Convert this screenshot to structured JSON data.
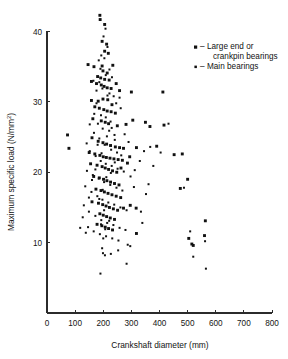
{
  "chart_data": {
    "type": "scatter",
    "title": "",
    "xlabel": "Crankshaft diameter (mm)",
    "ylabel": "Maximum specific load (N/mm²)",
    "ylabel_base": "Maximum specific load (N/mm",
    "ylabel_sup": "2",
    "ylabel_tail": ")",
    "xlim": [
      0,
      800
    ],
    "ylim": [
      0,
      42.5
    ],
    "grid": false,
    "xticks": [
      0,
      100,
      200,
      300,
      400,
      500,
      600,
      700,
      800
    ],
    "xtick_labels": [
      "0",
      "100",
      "200",
      "300",
      "400",
      "500",
      "600",
      "700",
      "800"
    ],
    "yticks": [
      10,
      20,
      30,
      40
    ],
    "ytick_labels": [
      "10",
      "20",
      "30",
      "40"
    ],
    "legend_position": "upper-right",
    "series": [
      {
        "name": "Large end or crankpin bearings",
        "marker": "square-large",
        "color": "#111111",
        "points": [
          [
            188,
            42.3
          ],
          [
            189,
            41.7
          ],
          [
            205,
            41.0
          ],
          [
            196,
            38.6
          ],
          [
            212,
            38.2
          ],
          [
            205,
            37.2
          ],
          [
            218,
            36.9
          ],
          [
            146,
            35.3
          ],
          [
            167,
            35.0
          ],
          [
            196,
            35.1
          ],
          [
            234,
            35.2
          ],
          [
            199,
            34.4
          ],
          [
            214,
            34.1
          ],
          [
            180,
            33.6
          ],
          [
            191,
            33.4
          ],
          [
            205,
            33.2
          ],
          [
            221,
            33.1
          ],
          [
            158,
            32.9
          ],
          [
            176,
            32.6
          ],
          [
            193,
            32.4
          ],
          [
            203,
            32.2
          ],
          [
            214,
            32.0
          ],
          [
            228,
            31.9
          ],
          [
            246,
            32.6
          ],
          [
            258,
            31.6
          ],
          [
            300,
            31.4
          ],
          [
            158,
            30.2
          ],
          [
            182,
            30.1
          ],
          [
            199,
            30.4
          ],
          [
            216,
            30.3
          ],
          [
            231,
            29.6
          ],
          [
            170,
            29.3
          ],
          [
            186,
            29.1
          ],
          [
            202,
            28.9
          ],
          [
            214,
            28.7
          ],
          [
            228,
            28.6
          ],
          [
            243,
            28.4
          ],
          [
            163,
            27.6
          ],
          [
            193,
            27.3
          ],
          [
            207,
            27.1
          ],
          [
            219,
            26.9
          ],
          [
            250,
            26.6
          ],
          [
            281,
            26.8
          ],
          [
            305,
            27.4
          ],
          [
            350,
            27.1
          ],
          [
            73,
            25.3
          ],
          [
            78,
            23.4
          ],
          [
            160,
            24.9
          ],
          [
            182,
            24.4
          ],
          [
            199,
            24.2
          ],
          [
            212,
            24.0
          ],
          [
            226,
            23.8
          ],
          [
            243,
            23.6
          ],
          [
            258,
            23.5
          ],
          [
            272,
            23.4
          ],
          [
            150,
            22.8
          ],
          [
            170,
            22.6
          ],
          [
            188,
            22.4
          ],
          [
            200,
            22.2
          ],
          [
            211,
            22.1
          ],
          [
            224,
            22.0
          ],
          [
            238,
            21.9
          ],
          [
            253,
            21.8
          ],
          [
            268,
            21.7
          ],
          [
            294,
            22.2
          ],
          [
            318,
            23.5
          ],
          [
            155,
            21.2
          ],
          [
            178,
            21.0
          ],
          [
            196,
            20.8
          ],
          [
            207,
            20.6
          ],
          [
            219,
            20.4
          ],
          [
            233,
            20.2
          ],
          [
            248,
            20.0
          ],
          [
            263,
            20.6
          ],
          [
            286,
            21.3
          ],
          [
            166,
            19.4
          ],
          [
            186,
            19.2
          ],
          [
            201,
            19.0
          ],
          [
            213,
            18.8
          ],
          [
            226,
            18.6
          ],
          [
            240,
            18.4
          ],
          [
            256,
            18.2
          ],
          [
            174,
            17.6
          ],
          [
            192,
            17.4
          ],
          [
            204,
            17.2
          ],
          [
            217,
            17.0
          ],
          [
            231,
            16.8
          ],
          [
            246,
            16.6
          ],
          [
            262,
            16.4
          ],
          [
            160,
            15.8
          ],
          [
            183,
            15.6
          ],
          [
            198,
            15.4
          ],
          [
            210,
            15.2
          ],
          [
            222,
            15.0
          ],
          [
            236,
            14.8
          ],
          [
            251,
            14.6
          ],
          [
            272,
            14.9
          ],
          [
            296,
            15.3
          ],
          [
            317,
            14.9
          ],
          [
            188,
            14.1
          ],
          [
            200,
            13.9
          ],
          [
            212,
            13.7
          ],
          [
            225,
            13.5
          ],
          [
            240,
            13.3
          ],
          [
            178,
            12.6
          ],
          [
            195,
            12.4
          ],
          [
            207,
            12.2
          ],
          [
            219,
            12.0
          ],
          [
            233,
            11.8
          ],
          [
            318,
            11.3
          ],
          [
            504,
            10.6
          ],
          [
            515,
            9.8
          ],
          [
            520,
            9.6
          ],
          [
            563,
            13.1
          ],
          [
            560,
            11.0
          ],
          [
            474,
            17.7
          ],
          [
            500,
            19.0
          ],
          [
            452,
            22.5
          ],
          [
            481,
            22.6
          ],
          [
            390,
            23.7
          ],
          [
            416,
            26.7
          ],
          [
            366,
            26.5
          ],
          [
            412,
            31.4
          ]
        ]
      },
      {
        "name": "Main bearings",
        "marker": "square-small",
        "color": "#111111",
        "points": [
          [
            204,
            36.2
          ],
          [
            190,
            34.7
          ],
          [
            209,
            33.8
          ],
          [
            186,
            32.8
          ],
          [
            197,
            31.9
          ],
          [
            222,
            31.2
          ],
          [
            237,
            30.8
          ],
          [
            176,
            29.8
          ],
          [
            192,
            28.1
          ],
          [
            209,
            27.8
          ],
          [
            181,
            26.9
          ],
          [
            198,
            26.2
          ],
          [
            221,
            25.9
          ],
          [
            240,
            25.3
          ],
          [
            167,
            25.6
          ],
          [
            186,
            24.8
          ],
          [
            205,
            23.9
          ],
          [
            228,
            23.2
          ],
          [
            249,
            22.8
          ],
          [
            264,
            22.4
          ],
          [
            152,
            23.0
          ],
          [
            173,
            22.3
          ],
          [
            191,
            21.6
          ],
          [
            209,
            21.2
          ],
          [
            230,
            20.9
          ],
          [
            251,
            20.5
          ],
          [
            273,
            20.1
          ],
          [
            142,
            20.2
          ],
          [
            163,
            19.6
          ],
          [
            184,
            19.1
          ],
          [
            203,
            18.6
          ],
          [
            225,
            18.2
          ],
          [
            247,
            17.8
          ],
          [
            268,
            17.4
          ],
          [
            136,
            18.0
          ],
          [
            158,
            17.2
          ],
          [
            179,
            16.6
          ],
          [
            197,
            16.1
          ],
          [
            218,
            15.7
          ],
          [
            239,
            15.4
          ],
          [
            261,
            15.0
          ],
          [
            283,
            14.6
          ],
          [
            131,
            15.3
          ],
          [
            149,
            14.4
          ],
          [
            172,
            13.8
          ],
          [
            193,
            13.2
          ],
          [
            214,
            12.8
          ],
          [
            236,
            12.5
          ],
          [
            258,
            12.1
          ],
          [
            279,
            11.8
          ],
          [
            127,
            13.6
          ],
          [
            146,
            12.2
          ],
          [
            166,
            11.6
          ],
          [
            188,
            11.2
          ],
          [
            210,
            10.9
          ],
          [
            232,
            10.6
          ],
          [
            254,
            10.3
          ],
          [
            196,
            9.2
          ],
          [
            199,
            8.5
          ],
          [
            206,
            8.2
          ],
          [
            253,
            8.9
          ],
          [
            287,
            9.7
          ],
          [
            296,
            9.5
          ],
          [
            283,
            7.0
          ],
          [
            190,
            5.6
          ],
          [
            334,
            14.4
          ],
          [
            339,
            12.8
          ],
          [
            352,
            16.9
          ],
          [
            361,
            18.3
          ],
          [
            309,
            17.9
          ],
          [
            297,
            19.4
          ],
          [
            312,
            20.3
          ],
          [
            330,
            21.6
          ],
          [
            345,
            23.0
          ],
          [
            290,
            24.3
          ],
          [
            276,
            25.4
          ],
          [
            262,
            29.1
          ],
          [
            246,
            29.8
          ],
          [
            258,
            30.6
          ],
          [
            230,
            26.3
          ],
          [
            241,
            24.6
          ],
          [
            215,
            30.9
          ],
          [
            176,
            31.6
          ],
          [
            168,
            28.3
          ],
          [
            152,
            26.8
          ],
          [
            141,
            24.1
          ],
          [
            172,
            20.4
          ],
          [
            160,
            18.9
          ],
          [
            149,
            16.4
          ],
          [
            138,
            11.4
          ],
          [
            118,
            12.1
          ],
          [
            520,
            8.0
          ],
          [
            565,
            6.3
          ],
          [
            562,
            10.2
          ],
          [
            509,
            11.6
          ],
          [
            487,
            17.8
          ],
          [
            432,
            26.9
          ],
          [
            404,
            22.8
          ],
          [
            378,
            20.9
          ],
          [
            367,
            23.6
          ],
          [
            208,
            40.4
          ],
          [
            201,
            39.3
          ],
          [
            215,
            37.8
          ],
          [
            193,
            36.6
          ],
          [
            184,
            35.9
          ],
          [
            222,
            34.6
          ],
          [
            231,
            33.5
          ],
          [
            165,
            33.0
          ],
          [
            207,
            11.9
          ],
          [
            221,
            13.1
          ],
          [
            203,
            14.6
          ],
          [
            186,
            16.2
          ],
          [
            198,
            17.5
          ],
          [
            211,
            19.3
          ],
          [
            227,
            19.9
          ],
          [
            241,
            21.4
          ],
          [
            194,
            22.7
          ],
          [
            180,
            23.9
          ],
          [
            213,
            25.1
          ],
          [
            226,
            27.2
          ],
          [
            192,
            12.6
          ],
          [
            200,
            10.6
          ],
          [
            227,
            8.4
          ]
        ]
      }
    ]
  },
  "legend": {
    "items": [
      {
        "dash": "–",
        "label": "Large end or",
        "label2": "crankpin bearings"
      },
      {
        "dash": "–",
        "label": "Main bearings",
        "label2": ""
      }
    ]
  }
}
